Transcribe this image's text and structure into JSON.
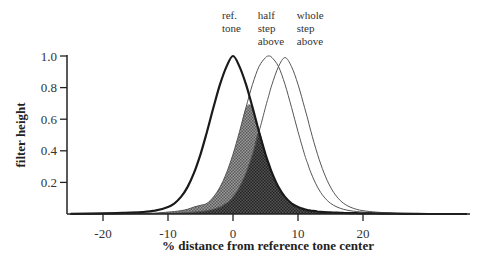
{
  "chart_data": {
    "type": "line",
    "title": "",
    "xlabel": "% distance from reference tone center",
    "ylabel": "filter height",
    "xlim": [
      -25,
      36
    ],
    "ylim": [
      0,
      1.0
    ],
    "x_ticks": [
      -20,
      -10,
      0,
      10,
      20
    ],
    "x_tick_labels": [
      "-20",
      "-10",
      "0",
      "10",
      "20"
    ],
    "y_ticks": [
      0.2,
      0.4,
      0.6,
      0.8,
      1.0
    ],
    "y_tick_labels": [
      "0.2",
      "0.4",
      "0.6",
      "0.8",
      "1.0"
    ],
    "grid": false,
    "legend": null,
    "annotations": [
      {
        "text_lines": [
          "ref.",
          "tone"
        ],
        "x": 0,
        "target_series": "ref. tone"
      },
      {
        "text_lines": [
          "half",
          "step",
          "above"
        ],
        "x": 5.5,
        "target_series": "half step above"
      },
      {
        "text_lines": [
          "whole",
          "step",
          "above"
        ],
        "x": 11.5,
        "target_series": "whole step above"
      }
    ],
    "shaded_regions": [
      {
        "name": "overlap ref & half step",
        "definition": "min(ref. tone, half step above)",
        "shade": "light stipple"
      },
      {
        "name": "overlap ref & whole step",
        "definition": "min(ref. tone, whole step above)",
        "shade": "dark stipple"
      }
    ],
    "x": [
      -25,
      -20,
      -17,
      -14,
      -12,
      -10,
      -9,
      -8,
      -7,
      -6,
      -5,
      -4,
      -3,
      -2,
      -1,
      0,
      1,
      2,
      3,
      4,
      5,
      5.5,
      6,
      7,
      8,
      9,
      10,
      11,
      11.5,
      12,
      13,
      14,
      15,
      16,
      17,
      18,
      19,
      20,
      22,
      24,
      26,
      28,
      30,
      33,
      36
    ],
    "series": [
      {
        "name": "ref. tone",
        "center": 0,
        "stroke": "#1a1a1a",
        "width": 2.2,
        "values": [
          0.001,
          0.004,
          0.007,
          0.012,
          0.021,
          0.044,
          0.068,
          0.108,
          0.17,
          0.26,
          0.378,
          0.521,
          0.675,
          0.82,
          0.933,
          1.0,
          0.933,
          0.82,
          0.675,
          0.521,
          0.378,
          0.317,
          0.26,
          0.17,
          0.108,
          0.068,
          0.044,
          0.03,
          0.025,
          0.021,
          0.016,
          0.012,
          0.01,
          0.008,
          0.007,
          0.006,
          0.005,
          0.004,
          0.003,
          0.002,
          0.001,
          0.001,
          0.0,
          0.0,
          0.0
        ]
      },
      {
        "name": "half step above",
        "center": 5.5,
        "stroke": "#555555",
        "width": 1.0,
        "values": [
          0.0,
          0.001,
          0.002,
          0.004,
          0.006,
          0.012,
          0.016,
          0.021,
          0.03,
          0.044,
          0.055,
          0.068,
          0.108,
          0.17,
          0.26,
          0.378,
          0.521,
          0.675,
          0.82,
          0.933,
          0.99,
          1.0,
          0.99,
          0.933,
          0.82,
          0.675,
          0.521,
          0.378,
          0.317,
          0.26,
          0.17,
          0.108,
          0.068,
          0.044,
          0.03,
          0.021,
          0.016,
          0.012,
          0.007,
          0.005,
          0.003,
          0.002,
          0.001,
          0.0,
          0.0
        ]
      },
      {
        "name": "whole step above",
        "center": 11.5,
        "stroke": "#555555",
        "width": 1.0,
        "values": [
          0.0,
          0.0,
          0.001,
          0.001,
          0.002,
          0.004,
          0.005,
          0.007,
          0.009,
          0.012,
          0.016,
          0.021,
          0.03,
          0.044,
          0.068,
          0.108,
          0.17,
          0.26,
          0.378,
          0.521,
          0.675,
          0.75,
          0.82,
          0.933,
          0.99,
          0.933,
          0.82,
          0.675,
          0.6,
          0.521,
          0.378,
          0.26,
          0.17,
          0.108,
          0.068,
          0.044,
          0.03,
          0.021,
          0.012,
          0.007,
          0.005,
          0.003,
          0.002,
          0.001,
          0.0
        ]
      }
    ]
  },
  "geometry": {
    "plot_left_px": 67,
    "baseline_px": 214,
    "x0_px": 233,
    "px_per_unit_x": 6.5,
    "px_per_unit_y": 158,
    "x_axis_end_px": 470
  }
}
